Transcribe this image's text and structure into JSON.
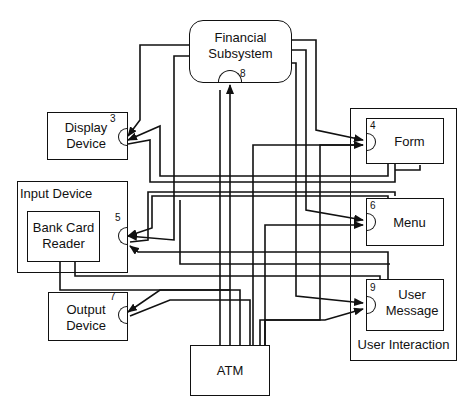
{
  "diagram": {
    "type": "component-connection-diagram",
    "stroke_color": "#111111",
    "background": "#ffffff",
    "components": [
      {
        "id": "financial",
        "label_line1": "Financial",
        "label_line2": "Subsystem",
        "port": "8",
        "shape": "rounded-rect"
      },
      {
        "id": "display",
        "label_line1": "Display",
        "label_line2": "Device",
        "port": "3"
      },
      {
        "id": "input_device",
        "label": "Input Device",
        "container": true
      },
      {
        "id": "bank_card",
        "label_line1": "Bank Card",
        "label_line2": "Reader",
        "port": "5",
        "parent": "input_device"
      },
      {
        "id": "output",
        "label_line1": "Output",
        "label_line2": "Device",
        "port": "7"
      },
      {
        "id": "atm",
        "label": "ATM"
      },
      {
        "id": "user_interaction",
        "label": "User Interaction",
        "container": true
      },
      {
        "id": "form",
        "label": "Form",
        "port": "4",
        "parent": "user_interaction"
      },
      {
        "id": "menu",
        "label": "Menu",
        "port": "6",
        "parent": "user_interaction"
      },
      {
        "id": "user_message",
        "label_line1": "User",
        "label_line2": "Message",
        "port": "9",
        "parent": "user_interaction"
      }
    ],
    "connections_to_ports": [
      {
        "port": "3",
        "target": "Display Device",
        "from": [
          "Financial Subsystem",
          "Bank Card Reader",
          "Form",
          "Menu",
          "ATM"
        ]
      },
      {
        "port": "4",
        "target": "Form",
        "from": [
          "Financial Subsystem",
          "ATM"
        ]
      },
      {
        "port": "5",
        "target": "Bank Card Reader",
        "from": [
          "Form",
          "Menu",
          "User Message",
          "Financial Subsystem"
        ]
      },
      {
        "port": "6",
        "target": "Menu",
        "from": [
          "Financial Subsystem",
          "ATM"
        ]
      },
      {
        "port": "7",
        "target": "Output Device",
        "from": [
          "Financial Subsystem",
          "ATM"
        ]
      },
      {
        "port": "8",
        "target": "Financial Subsystem",
        "from": [
          "ATM"
        ]
      },
      {
        "port": "9",
        "target": "User Message",
        "from": [
          "Bank Card Reader",
          "Financial Subsystem",
          "ATM"
        ]
      }
    ]
  }
}
